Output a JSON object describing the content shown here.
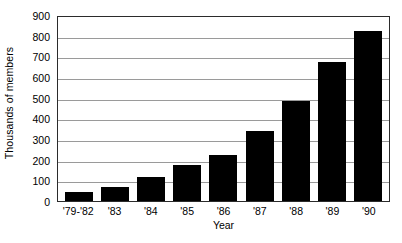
{
  "chart_data": {
    "type": "bar",
    "title": "",
    "xlabel": "Year",
    "ylabel": "Thousands of members",
    "categories": [
      "'79-'82",
      "'83",
      "'84",
      "'85",
      "'86",
      "'87",
      "'88",
      "'89",
      "'90"
    ],
    "values": [
      45,
      68,
      118,
      175,
      225,
      340,
      483,
      673,
      822
    ],
    "series": [
      {
        "name": "Members",
        "values": [
          45,
          68,
          118,
          175,
          225,
          340,
          483,
          673,
          822
        ]
      }
    ],
    "ylim": [
      0,
      900
    ],
    "yticks": [
      0,
      100,
      200,
      300,
      400,
      500,
      600,
      700,
      800,
      900
    ],
    "ytick_labels": [
      "0",
      "100",
      "200",
      "300",
      "400",
      "500",
      "600",
      "700",
      "800",
      "900"
    ],
    "grid": true,
    "legend": "none",
    "bar_color": "#000000",
    "gridline_color": "#9a9a9a",
    "axis_color": "#2b2b2b",
    "background_color": "#ffffff"
  }
}
